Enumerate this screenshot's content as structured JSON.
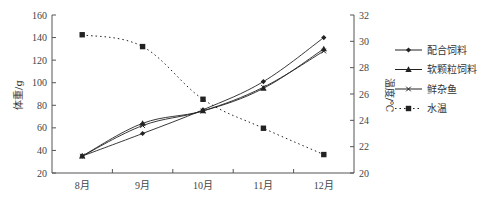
{
  "chart_data": {
    "type": "line",
    "title": "",
    "categories": [
      "8月",
      "9月",
      "10月",
      "11月",
      "12月"
    ],
    "xlabel": "",
    "ylabel": "体重/g",
    "ylabel_right": "温度/℃",
    "ylim": [
      20,
      160
    ],
    "yticks": [
      20,
      40,
      60,
      80,
      100,
      120,
      140,
      160
    ],
    "ylim_right": [
      20,
      32
    ],
    "yticks_right": [
      20,
      22,
      24,
      26,
      28,
      30,
      32
    ],
    "grid": false,
    "legend_position": "right",
    "series": [
      {
        "name": "配合饲料",
        "axis": "left",
        "marker": "diamond",
        "line": "solid",
        "values": [
          35,
          55,
          76,
          101,
          140
        ]
      },
      {
        "name": "软颗粒饲料",
        "axis": "left",
        "marker": "triangle",
        "line": "solid",
        "values": [
          35,
          64,
          75,
          95,
          130
        ]
      },
      {
        "name": "鲜杂鱼",
        "axis": "left",
        "marker": "x",
        "line": "solid",
        "values": [
          35,
          62,
          75,
          96,
          128
        ]
      },
      {
        "name": "水温",
        "axis": "right",
        "marker": "square",
        "line": "dotted",
        "values": [
          30.5,
          29.6,
          25.6,
          23.4,
          21.4
        ]
      }
    ]
  },
  "colors": {
    "line": "#222222",
    "axis": "#555555"
  }
}
